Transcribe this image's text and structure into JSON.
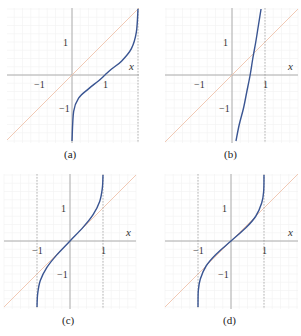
{
  "figure": {
    "panels": [
      {
        "id": "a",
        "caption": "(a)",
        "x_label": "x",
        "tick_labels": {
          "x_neg1": "−1",
          "x_pos1": "1",
          "y_pos1": "1",
          "y_neg1": "−1"
        }
      },
      {
        "id": "b",
        "caption": "(b)",
        "x_label": "x",
        "tick_labels": {
          "x_neg1": "−1",
          "x_pos1": "1",
          "y_pos1": "1",
          "y_neg1": "−1"
        }
      },
      {
        "id": "c",
        "caption": "(c)",
        "x_label": "x",
        "tick_labels": {
          "x_neg1": "−1",
          "x_pos1": "1",
          "y_pos1": "1",
          "y_neg1": "−1"
        }
      },
      {
        "id": "d",
        "caption": "(d)",
        "x_label": "x",
        "tick_labels": {
          "x_neg1": "−1",
          "x_pos1": "1",
          "y_pos1": "1",
          "y_neg1": "−1"
        }
      }
    ],
    "colors": {
      "curve": "#3a5592",
      "identity_line": "#efc3ad",
      "axis": "#9a9a9a",
      "dashed_asymptote": "#8a8a8a"
    }
  },
  "chart_data": [
    {
      "type": "line",
      "title": "(a)",
      "xlabel": "x",
      "ylabel": "",
      "xlim": [
        -2,
        2
      ],
      "ylim": [
        -2,
        2
      ],
      "grid": true,
      "series": [
        {
          "name": "identity y=x",
          "x": [
            -2,
            2
          ],
          "y": [
            -2,
            2
          ]
        },
        {
          "name": "curve",
          "x": [
            0.0,
            0.05,
            0.2,
            0.5,
            0.8,
            1.0,
            1.2,
            1.5,
            1.8,
            1.95,
            2.0
          ],
          "y": [
            -2.0,
            -1.1,
            -0.7,
            -0.42,
            -0.18,
            0.0,
            0.18,
            0.42,
            0.8,
            1.3,
            2.0
          ]
        }
      ],
      "vertical_asymptotes_dashed": [
        2
      ]
    },
    {
      "type": "line",
      "title": "(b)",
      "xlabel": "x",
      "ylabel": "",
      "xlim": [
        -2,
        2
      ],
      "ylim": [
        -2,
        2
      ],
      "grid": true,
      "series": [
        {
          "name": "identity y=x",
          "x": [
            -2,
            2
          ],
          "y": [
            -2,
            2
          ]
        },
        {
          "name": "curve",
          "x": [
            0.12,
            0.22,
            0.35,
            0.45,
            0.55,
            0.63,
            0.72,
            0.8,
            0.88
          ],
          "y": [
            -2.0,
            -1.5,
            -1.0,
            -0.5,
            0.0,
            0.5,
            1.0,
            1.5,
            2.0
          ]
        }
      ],
      "vertical_asymptotes_dashed": [
        1
      ]
    },
    {
      "type": "line",
      "title": "(c)",
      "xlabel": "x",
      "ylabel": "",
      "xlim": [
        -2,
        2
      ],
      "ylim": [
        -2,
        2
      ],
      "grid": true,
      "series": [
        {
          "name": "identity y=x",
          "x": [
            -2,
            2
          ],
          "y": [
            -2,
            2
          ]
        },
        {
          "name": "curve",
          "x": [
            -1.0,
            -0.98,
            -0.9,
            -0.7,
            -0.4,
            0.0,
            0.4,
            0.7,
            0.9,
            0.98,
            1.0
          ],
          "y": [
            -2.0,
            -1.6,
            -1.2,
            -0.8,
            -0.42,
            0.0,
            0.42,
            0.8,
            1.2,
            1.6,
            2.0
          ]
        }
      ],
      "vertical_asymptotes_dashed": [
        -1,
        1
      ]
    },
    {
      "type": "line",
      "title": "(d)",
      "xlabel": "x",
      "ylabel": "",
      "xlim": [
        -2,
        2
      ],
      "ylim": [
        -2,
        2
      ],
      "grid": true,
      "series": [
        {
          "name": "identity y=x",
          "x": [
            -2,
            2
          ],
          "y": [
            -2,
            2
          ]
        },
        {
          "name": "curve",
          "x": [
            -1.0,
            -0.99,
            -0.93,
            -0.75,
            -0.45,
            0.0,
            0.45,
            0.75,
            0.93,
            0.99,
            1.0
          ],
          "y": [
            -2.0,
            -1.5,
            -1.15,
            -0.75,
            -0.4,
            0.0,
            0.4,
            0.75,
            1.15,
            1.5,
            2.0
          ]
        }
      ],
      "vertical_asymptotes_dashed": [
        -1,
        1
      ]
    }
  ]
}
